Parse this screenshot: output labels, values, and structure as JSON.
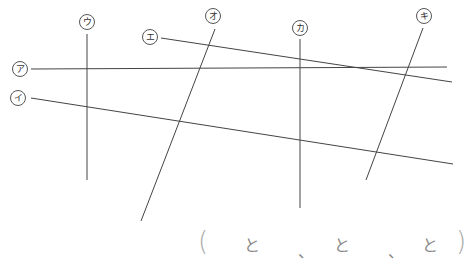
{
  "diagram": {
    "line_color": "#444444",
    "labels": [
      {
        "id": "a",
        "text": "ア",
        "x": 20,
        "y": 69
      },
      {
        "id": "i",
        "text": "イ",
        "x": 18,
        "y": 98
      },
      {
        "id": "u",
        "text": "ウ",
        "x": 87,
        "y": 22
      },
      {
        "id": "e",
        "text": "エ",
        "x": 150,
        "y": 37
      },
      {
        "id": "o",
        "text": "オ",
        "x": 213,
        "y": 16
      },
      {
        "id": "ka",
        "text": "カ",
        "x": 300,
        "y": 28
      },
      {
        "id": "ki",
        "text": "キ",
        "x": 424,
        "y": 16
      }
    ],
    "lines": [
      {
        "label": "ア",
        "x1": 31,
        "y1": 69,
        "x2": 447,
        "y2": 67
      },
      {
        "label": "イ",
        "x1": 31,
        "y1": 98,
        "x2": 453,
        "y2": 164
      },
      {
        "label": "ウ",
        "x1": 87,
        "y1": 34,
        "x2": 87,
        "y2": 180
      },
      {
        "label": "エ",
        "x1": 161,
        "y1": 38,
        "x2": 452,
        "y2": 82
      },
      {
        "label": "オ",
        "x1": 215,
        "y1": 29,
        "x2": 141,
        "y2": 221
      },
      {
        "label": "カ",
        "x1": 300,
        "y1": 39,
        "x2": 300,
        "y2": 208
      },
      {
        "label": "キ",
        "x1": 423,
        "y1": 28,
        "x2": 366,
        "y2": 180
      }
    ]
  },
  "answer": {
    "open_paren": "(",
    "to1": "と",
    "comma1": "、",
    "to2": "と",
    "comma2": "、",
    "to3": "と",
    "close_paren": ")"
  }
}
